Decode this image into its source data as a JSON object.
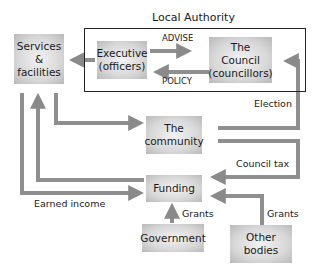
{
  "diagram": {
    "title": "Local Authority",
    "nodes": {
      "services": {
        "line1": "Services",
        "line2": "&",
        "line3": "facilities"
      },
      "executive": {
        "line1": "Executive",
        "line2": "(officers)"
      },
      "council": {
        "line1": "The",
        "line2": "Council",
        "line3": "(councillors)"
      },
      "community": {
        "line1": "The",
        "line2": "community"
      },
      "funding": {
        "line1": "Funding"
      },
      "government": {
        "line1": "Government"
      },
      "other_bodies": {
        "line1": "Other",
        "line2": "bodies"
      }
    },
    "edges": {
      "advise": "ADVISE",
      "policy": "POLICY",
      "election": "Election",
      "council_tax": "Council tax",
      "earned_income": "Earned income",
      "grants_government": "Grants",
      "grants_other": "Grants"
    },
    "colors": {
      "arrow": "#8a8a8a",
      "box_light": "#f2f2f2",
      "box_dark": "#b9b9b9",
      "frame": "#222222"
    }
  }
}
